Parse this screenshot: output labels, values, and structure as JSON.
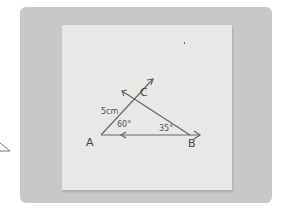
{
  "figure": {
    "vertices": {
      "A": "A",
      "B": "B",
      "C": "C"
    },
    "side_label": "5cm",
    "angle_A": "60°",
    "angle_B": "35°"
  }
}
